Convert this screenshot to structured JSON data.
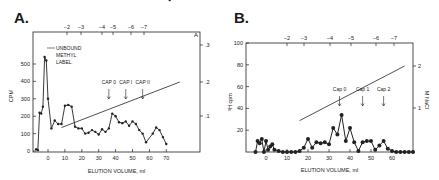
{
  "panels": {
    "a": {
      "label": "A."
    },
    "b": {
      "label": "B."
    }
  },
  "chart_data": [
    {
      "type": "line",
      "panel": "A.",
      "title": "",
      "xlabel": "ELUTION VOLUME, ml",
      "ylabel": "CPM",
      "y2label": "A",
      "xlim": [
        -8,
        78
      ],
      "ylim": [
        0,
        600
      ],
      "y2ticks": [
        ".1",
        ".2",
        ".3"
      ],
      "xticks": [
        "0",
        "10",
        "20",
        "30",
        "40",
        "50",
        "60",
        "70"
      ],
      "yticks": [
        "0",
        "100",
        "200",
        "300",
        "400",
        "500"
      ],
      "top_ticks": [
        "-2",
        "-3",
        "-4",
        "-5",
        "-6",
        "-7"
      ],
      "annotations": [
        "UNBOUND METHYL LABEL",
        "CAP 0",
        "CAP I",
        "CAP II"
      ],
      "cap_positions_ml": [
        36,
        46,
        56
      ],
      "grid": false,
      "series": [
        {
          "name": "CPM",
          "x": [
            -7,
            -6,
            -5,
            -4,
            -3,
            -2,
            -1,
            0,
            2,
            4,
            6,
            8,
            10,
            12,
            14,
            16,
            18,
            20,
            22,
            24,
            26,
            28,
            30,
            32,
            34,
            36,
            38,
            40,
            42,
            44,
            46,
            48,
            50,
            52,
            54,
            56,
            58,
            62,
            64,
            66,
            68,
            70,
            72
          ],
          "values": [
            10,
            5,
            220,
            215,
            255,
            540,
            520,
            300,
            130,
            175,
            155,
            155,
            260,
            265,
            255,
            140,
            130,
            130,
            100,
            105,
            120,
            110,
            95,
            125,
            110,
            130,
            215,
            200,
            165,
            160,
            170,
            145,
            170,
            155,
            120,
            100,
            50,
            100,
            135,
            120,
            80,
            40
          ]
        },
        {
          "name": "Salt gradient (A)",
          "x": [
            8,
            78
          ],
          "values": [
            0.066,
            0.2
          ]
        }
      ]
    },
    {
      "type": "line",
      "panel": "B.",
      "title": "",
      "xlabel": "ELUTION VOLUME, ml",
      "ylabel": "³H cpm",
      "y2label": "M NaCl",
      "xlim": [
        -8,
        70
      ],
      "ylim": [
        0,
        100
      ],
      "xticks": [
        "0",
        "10",
        "20",
        "30",
        "40",
        "50",
        "60"
      ],
      "yticks": [
        "20",
        "40",
        "60",
        "80",
        "100"
      ],
      "y2ticks": [
        "1",
        "2"
      ],
      "top_ticks": [
        "-2",
        "-3",
        "-4",
        "-5",
        "-6",
        "-7"
      ],
      "annotations": [
        "Cap 0",
        "Cap 1",
        "Cap 2"
      ],
      "cap_positions_ml": [
        35,
        46,
        56
      ],
      "grid": false,
      "series": [
        {
          "name": "³H cpm",
          "x": [
            -5,
            -4,
            -3,
            -2,
            -1,
            0,
            1,
            2,
            3,
            4,
            6,
            8,
            10,
            12,
            14,
            16,
            18,
            20,
            22,
            24,
            26,
            28,
            30,
            32,
            34,
            36,
            38,
            40,
            42,
            44,
            46,
            48,
            50,
            52,
            54,
            56,
            58,
            60,
            62,
            64,
            66,
            68,
            70
          ],
          "values": [
            0,
            10,
            8,
            12,
            0,
            10,
            2,
            5,
            7,
            2,
            1,
            0,
            0,
            0,
            0,
            1,
            4,
            12,
            4,
            9,
            8,
            9,
            7,
            22,
            16,
            34,
            10,
            22,
            9,
            1,
            9,
            10,
            10,
            2,
            6,
            10,
            3,
            1,
            0,
            0,
            0,
            0,
            0
          ]
        },
        {
          "name": "Salt gradient (M NaCl)",
          "x": [
            16,
            66
          ],
          "values": [
            0.7,
            2.0
          ]
        }
      ]
    }
  ]
}
